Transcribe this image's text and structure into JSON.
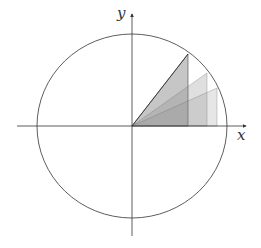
{
  "diagram": {
    "type": "unit-circle-triangles",
    "axes": {
      "x_label": "x",
      "y_label": "y"
    },
    "circle": {
      "center": [
        132,
        126
      ],
      "rx": 95,
      "ry": 92
    },
    "triangles": [
      {
        "name": "triangle-1",
        "apex": [
          188,
          54
        ],
        "foot": [
          188,
          126
        ],
        "opacity": 0.45
      },
      {
        "name": "triangle-2",
        "apex": [
          207,
          73
        ],
        "foot": [
          207,
          126
        ],
        "opacity": 0.25
      },
      {
        "name": "triangle-3",
        "apex": [
          217,
          88
        ],
        "foot": [
          217,
          126
        ],
        "opacity": 0.2
      }
    ],
    "colors": {
      "stroke": "#333333",
      "fill": "#808080",
      "background": "#ffffff"
    }
  }
}
